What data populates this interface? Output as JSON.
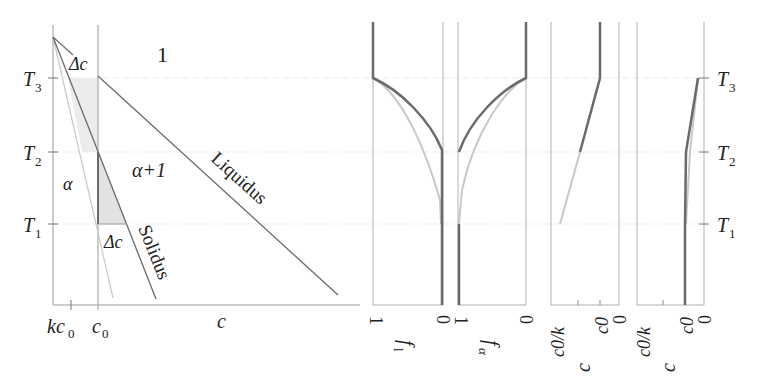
{
  "phase_diagram": {
    "regions": {
      "liquid": "1",
      "two_phase": "α+1",
      "solid": "α"
    },
    "curves": {
      "liquidus": "Liquidus",
      "solidus": "Solidus"
    },
    "annotations": {
      "delta_top": "Δc",
      "delta_bottom": "Δc"
    },
    "y_ticks": [
      {
        "label": "T",
        "sub": "3"
      },
      {
        "label": "T",
        "sub": "2"
      },
      {
        "label": "T",
        "sub": "1"
      }
    ],
    "x_labels": {
      "kc0": "kc",
      "kc0_sub": "0",
      "c0": "c",
      "c0_sub": "0",
      "axis": "c"
    }
  },
  "panels": {
    "f_l": {
      "label": "f",
      "sub": "l",
      "tick_left": "1",
      "tick_right": "0"
    },
    "f_alpha": {
      "label": "f",
      "sub": "α",
      "tick_left": "1",
      "tick_right": "0"
    },
    "c_l": {
      "label": "c",
      "sub": "l",
      "tick1": "c0/k",
      "tick2": "c0",
      "tick3": "0"
    },
    "c_alpha": {
      "label": "c",
      "sub": "α",
      "tick1": "c0/k",
      "tick2": "c0",
      "tick3": "0"
    }
  },
  "right_axis_ticks": [
    {
      "label": "T",
      "sub": "3"
    },
    {
      "label": "T",
      "sub": "2"
    },
    {
      "label": "T",
      "sub": "1"
    }
  ],
  "colors": {
    "dark": "#6a6a6a",
    "light": "#c8c8c8",
    "axis": "#9a9a9a",
    "shade": "#e4e4e4",
    "guide": "#ededed"
  }
}
